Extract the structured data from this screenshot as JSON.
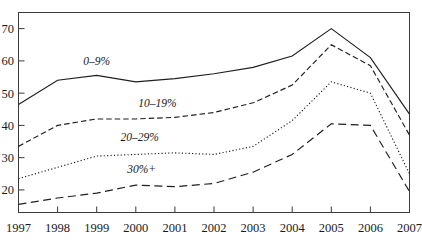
{
  "chart_data": {
    "type": "line",
    "title": "",
    "subtitle": "",
    "xlabel": "",
    "ylabel": "",
    "categories": [
      "1997",
      "1998",
      "1999",
      "2000",
      "2001",
      "2002",
      "2003",
      "2004",
      "2005",
      "2006",
      "2007"
    ],
    "x": [
      1997,
      1998,
      1999,
      2000,
      2001,
      2002,
      2003,
      2004,
      2005,
      2006,
      2007
    ],
    "xlim": [
      1997,
      2007
    ],
    "ylim": [
      13,
      75
    ],
    "y_ticks": [
      20,
      30,
      40,
      50,
      60,
      70
    ],
    "y_tick_labels": [
      "20",
      "30",
      "40",
      "50",
      "60",
      "70"
    ],
    "x_ticks": [
      1997,
      1998,
      1999,
      2000,
      2001,
      2002,
      2003,
      2004,
      2005,
      2006,
      2007
    ],
    "x_tick_labels": [
      "1997",
      "1998",
      "1999",
      "2000",
      "2001",
      "2002",
      "2003",
      "2004",
      "2005",
      "2006",
      "2007"
    ],
    "grid": false,
    "legend_position": "inline-annotation",
    "frame": true,
    "series": [
      {
        "name": "0–9%",
        "label": "0–9%",
        "style": "solid",
        "color": "#1f1f1f",
        "label_x": 1999.0,
        "label_y": 58.8,
        "values": [
          46.5,
          54.0,
          55.5,
          53.5,
          54.5,
          56.0,
          58.0,
          61.5,
          70.0,
          61.0,
          43.5
        ]
      },
      {
        "name": "10–19%",
        "label": "10–19%",
        "style": "dashed",
        "color": "#1f1f1f",
        "label_x": 2000.55,
        "label_y": 45.6,
        "values": [
          33.5,
          40.0,
          42.0,
          42.0,
          42.5,
          44.0,
          47.0,
          52.5,
          65.0,
          58.5,
          37.0
        ]
      },
      {
        "name": "20–29%",
        "label": "20–29%",
        "style": "dotted",
        "color": "#1f1f1f",
        "label_x": 2000.1,
        "label_y": 35.1,
        "values": [
          23.5,
          27.0,
          30.5,
          31.0,
          31.5,
          31.0,
          33.5,
          41.5,
          53.5,
          50.0,
          25.0
        ]
      },
      {
        "name": "30%+",
        "label": "30%+",
        "style": "longdash",
        "color": "#1f1f1f",
        "label_x": 2000.15,
        "label_y": 25.4,
        "values": [
          15.5,
          17.5,
          19.0,
          21.5,
          21.0,
          22.0,
          25.5,
          31.0,
          40.5,
          40.0,
          19.5
        ]
      }
    ]
  }
}
